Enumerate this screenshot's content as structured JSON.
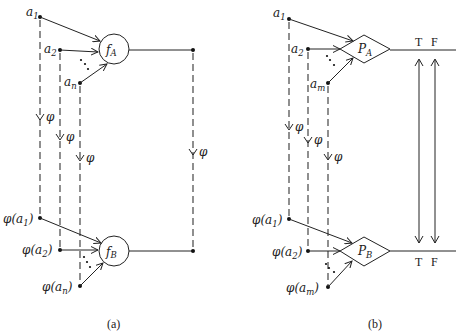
{
  "panel_a": {
    "caption": "(a)",
    "top_node_label_f": "f",
    "top_node_label_sub": "A",
    "bottom_node_label_f": "f",
    "bottom_node_label_sub": "B",
    "inputs_top": [
      {
        "base": "a",
        "sub": "1"
      },
      {
        "base": "a",
        "sub": "2"
      },
      {
        "base": "a",
        "sub": "n"
      }
    ],
    "inputs_bottom": [
      {
        "pre": "φ(a",
        "sub": "1",
        "post": ")"
      },
      {
        "pre": "φ(a",
        "sub": "2",
        "post": ")"
      },
      {
        "pre": "φ(a",
        "sub": "n",
        "post": ")"
      }
    ],
    "mapping_label": "φ"
  },
  "panel_b": {
    "caption": "(b)",
    "top_node_label_p": "P",
    "top_node_label_sub": "A",
    "bottom_node_label_p": "P",
    "bottom_node_label_sub": "B",
    "inputs_top": [
      {
        "base": "a",
        "sub": "1"
      },
      {
        "base": "a",
        "sub": "2"
      },
      {
        "base": "a",
        "sub": "m"
      }
    ],
    "inputs_bottom": [
      {
        "pre": "φ(a",
        "sub": "1",
        "post": ")"
      },
      {
        "pre": "φ(a",
        "sub": "2",
        "post": ")"
      },
      {
        "pre": "φ(a",
        "sub": "m",
        "post": ")"
      }
    ],
    "mapping_label": "φ",
    "true_label": "T",
    "false_label": "F"
  }
}
